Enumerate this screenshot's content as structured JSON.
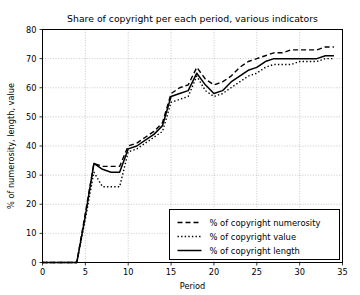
{
  "chart_data": {
    "type": "line",
    "title": "Share of copyright per each period, various indicators",
    "xlabel": "Period",
    "ylabel": "% of numerosity, length, value",
    "xlim": [
      0,
      35
    ],
    "ylim": [
      0,
      80
    ],
    "xticks": [
      0,
      5,
      10,
      15,
      20,
      25,
      30,
      35
    ],
    "yticks": [
      0,
      10,
      20,
      30,
      40,
      50,
      60,
      70,
      80
    ],
    "grid": true,
    "legend_position": "lower right",
    "x": [
      0,
      1,
      2,
      3,
      4,
      5,
      6,
      7,
      8,
      9,
      10,
      11,
      12,
      13,
      14,
      15,
      16,
      17,
      18,
      19,
      20,
      21,
      22,
      23,
      24,
      25,
      26,
      27,
      28,
      29,
      30,
      31,
      32,
      33,
      34
    ],
    "series": [
      {
        "name": "% of copyright numerosity",
        "style": "dashed",
        "color": "#000000",
        "values": [
          0,
          0,
          0,
          0,
          0,
          17,
          34,
          33,
          33,
          33,
          40,
          41,
          43,
          45,
          48,
          58,
          60,
          61,
          67,
          63,
          61,
          62,
          64,
          67,
          69,
          70,
          71,
          72,
          72,
          73,
          73,
          73,
          73,
          74,
          74
        ]
      },
      {
        "name": "% of copyright value",
        "style": "dotted",
        "color": "#000000",
        "values": [
          0,
          0,
          0,
          0,
          0,
          15,
          31,
          26,
          26,
          26,
          38,
          39,
          41,
          43,
          45,
          55,
          56,
          57,
          64,
          59,
          57,
          58,
          60,
          62,
          64,
          65,
          67,
          68,
          68,
          68,
          69,
          69,
          69,
          70,
          70
        ]
      },
      {
        "name": "% of copyright length",
        "style": "solid",
        "color": "#000000",
        "values": [
          0,
          0,
          0,
          0,
          0,
          16,
          34,
          32,
          31,
          31,
          39,
          40,
          42,
          44,
          47,
          57,
          58,
          59,
          65,
          61,
          58,
          59,
          62,
          64,
          66,
          67,
          69,
          70,
          70,
          70,
          70,
          70,
          70,
          71,
          71
        ]
      }
    ]
  }
}
